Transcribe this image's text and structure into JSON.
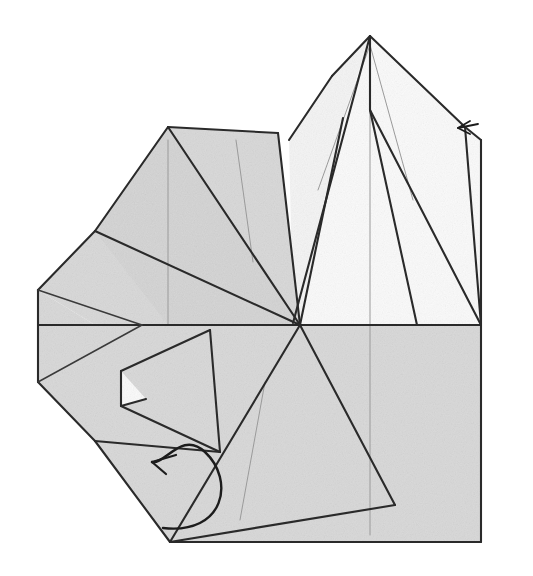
{
  "figure": {
    "kind": "origami-fold-diagram",
    "title": "",
    "caption": "",
    "step_number": "",
    "background_color": "#ffffff",
    "canvas": {
      "width": 533,
      "height": 576
    }
  },
  "palette": {
    "paper_front_gray": "#dadada",
    "paper_front_gray_alt": "#d6d6d6",
    "paper_back_white": "#fbfbfb",
    "paper_back_white_alt": "#f5f5f5",
    "edge_line": "#2a2a2a",
    "crease_line": "#9a9a9a",
    "arrow_line": "#1c1c1c"
  },
  "geometry": {
    "outline": {
      "name": "model-silhouette",
      "points": "370,36 465,127 481,140 481,542 170,542 95,441 38,382 38,290 95,231 168,127 278,133 300,128 332,76"
    },
    "panels": [
      {
        "name": "upper-left-gray-wing",
        "shade": "gray",
        "points": "168,127 278,133 300,325 95,325 95,231"
      },
      {
        "name": "left-point-gray",
        "shade": "gray",
        "points": "38,290 95,231 142,325 95,325"
      },
      {
        "name": "left-lower-gray",
        "shade": "gray",
        "points": "38,290 38,382 95,441 170,542 300,325 95,325"
      },
      {
        "name": "mid-left-triangle-panel",
        "shade": "gray2",
        "points": "95,231 168,325 300,325 168,127"
      },
      {
        "name": "lower-right-gray-body",
        "shade": "gray",
        "points": "300,325 481,325 481,542 170,542"
      },
      {
        "name": "upper-right-white-flap",
        "shade": "white",
        "points": "370,36 465,127 481,140 481,325 300,325 332,76"
      },
      {
        "name": "left-white-sliver",
        "shade": "white2",
        "points": "332,76 370,36 343,118 300,325 293,323 289,140"
      },
      {
        "name": "small-white-triangle",
        "shade": "white",
        "points": "121,371 146,399 121,406"
      }
    ],
    "edges": [
      {
        "name": "outline-upper-right-from-apex",
        "d": "M370,36 L465,127"
      },
      {
        "name": "outline-right-upper-to-shoulder",
        "d": "M465,127 L481,140"
      },
      {
        "name": "outline-right-vertical",
        "d": "M481,140 L481,542"
      },
      {
        "name": "outline-bottom",
        "d": "M170,542 L481,542"
      },
      {
        "name": "outline-lower-left-diagonal",
        "d": "M95,441 L170,542"
      },
      {
        "name": "outline-left-lower-edge",
        "d": "M38,382 L95,441"
      },
      {
        "name": "outline-left-vertical",
        "d": "M38,290 L38,382"
      },
      {
        "name": "outline-left-upper-edge",
        "d": "M38,290 L95,231"
      },
      {
        "name": "outline-upper-left-ridge",
        "d": "M95,231 L168,127"
      },
      {
        "name": "outline-top-left-span",
        "d": "M168,127 L278,133"
      },
      {
        "name": "outline-apex-left-slope",
        "d": "M332,76 L370,36"
      },
      {
        "name": "outline-left-of-peak-drop",
        "d": "M332,76 L289,140"
      },
      {
        "name": "horizon-center-line",
        "d": "M38,325 L481,325"
      },
      {
        "name": "left-point-upper-crease",
        "d": "M38,290 L142,325"
      },
      {
        "name": "left-point-lower-crease",
        "d": "M38,382 L142,325"
      },
      {
        "name": "wing-diagonal-from-apex",
        "d": "M168,127 L300,325"
      },
      {
        "name": "wing-outer-diagonal",
        "d": "M278,133 L300,325"
      },
      {
        "name": "mid-ridge-to-horizon",
        "d": "M95,231 L300,325"
      },
      {
        "name": "peak-center-drop",
        "d": "M370,36 L370,110"
      },
      {
        "name": "peak-left-inner",
        "d": "M370,36 L293,323"
      },
      {
        "name": "peak-left-outer",
        "d": "M343,118 L300,325"
      },
      {
        "name": "peak-right-inner",
        "d": "M370,110 L417,325"
      },
      {
        "name": "peak-right-outer",
        "d": "M370,110 L481,325"
      },
      {
        "name": "right-edge-descend",
        "d": "M465,127 L481,325"
      },
      {
        "name": "lower-big-triangle-left",
        "d": "M300,325 L170,542"
      },
      {
        "name": "lower-big-triangle-right",
        "d": "M300,325 L395,505"
      },
      {
        "name": "lower-big-triangle-base",
        "d": "M170,542 L395,505"
      },
      {
        "name": "inner-flap-upper",
        "d": "M210,330 L121,371"
      },
      {
        "name": "inner-flap-left",
        "d": "M121,371 L121,406"
      },
      {
        "name": "inner-flap-diag",
        "d": "M121,406 L146,399"
      },
      {
        "name": "inner-flap-fold",
        "d": "M121,406 L220,452"
      },
      {
        "name": "inner-flap-right",
        "d": "M210,330 L220,452"
      },
      {
        "name": "inner-flap-return",
        "d": "M95,441 L220,452"
      }
    ],
    "creases": [
      {
        "name": "crease-left-wing-vertical",
        "d": "M168,140 L168,325"
      },
      {
        "name": "crease-wing-inner-diag",
        "d": "M236,140 L253,262"
      },
      {
        "name": "crease-peak-left-faint",
        "d": "M370,45 L318,190"
      },
      {
        "name": "crease-peak-right-faint",
        "d": "M370,45 L413,200"
      },
      {
        "name": "crease-peak-center-faint",
        "d": "M370,110 L370,325"
      },
      {
        "name": "crease-body-center-vertical",
        "d": "M370,325 L370,535"
      },
      {
        "name": "crease-lower-left-diag",
        "d": "M265,382 L240,520"
      },
      {
        "name": "crease-left-horizon-extension",
        "d": "M38,325 L95,325"
      }
    ],
    "arrows": [
      {
        "name": "fold-arrow-curved",
        "path": "M163,528 C225,535 235,480 205,452 C182,430 165,465 152,462",
        "head": "M152,462 L176,455 M152,462 L166,474"
      },
      {
        "name": "pin-arrow-right-edge",
        "shaft": "M478,124 L458,128",
        "head": "M458,128 L470,121 M458,128 L470,134"
      }
    ]
  },
  "labels": {
    "items": []
  }
}
